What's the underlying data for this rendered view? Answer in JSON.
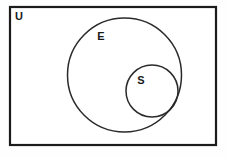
{
  "diagram": {
    "type": "venn-euler",
    "background_color": "#fefefe",
    "canvas": {
      "width": 227,
      "height": 157
    },
    "universe": {
      "label": "U",
      "shape": "rectangle",
      "x": 10,
      "y": 7,
      "width": 206,
      "height": 138,
      "stroke_color": "#1b1b1b",
      "stroke_width": 2.2,
      "fill_color": "#ffffff",
      "label_x": 19,
      "label_y": 17
    },
    "sets": [
      {
        "label": "E",
        "shape": "circle",
        "cx": 124.5,
        "cy": 75,
        "r": 57,
        "stroke_color": "#2a2a2a",
        "stroke_width": 1.5,
        "fill_color": "none",
        "label_x": 101,
        "label_y": 37
      },
      {
        "label": "S",
        "shape": "circle",
        "cx": 152,
        "cy": 91,
        "r": 26,
        "stroke_color": "#2a2a2a",
        "stroke_width": 1.5,
        "fill_color": "none",
        "label_x": 141,
        "label_y": 81
      }
    ]
  }
}
